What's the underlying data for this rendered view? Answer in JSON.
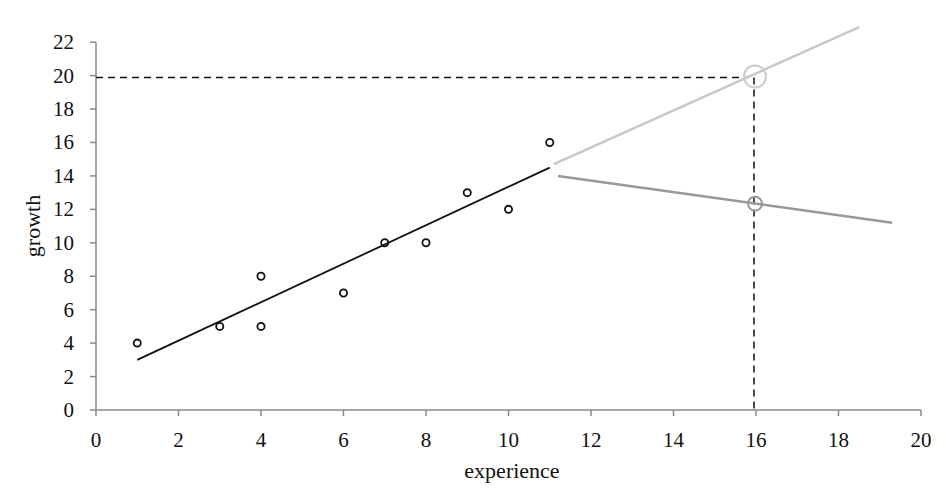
{
  "chart_data": {
    "type": "scatter",
    "title": "",
    "xlabel": "experience",
    "ylabel": "growth",
    "xlim": [
      0,
      20
    ],
    "ylim": [
      0,
      22
    ],
    "x_ticks": [
      0,
      2,
      4,
      6,
      8,
      10,
      12,
      14,
      16,
      18,
      20
    ],
    "y_ticks": [
      0,
      2,
      4,
      6,
      8,
      10,
      12,
      14,
      16,
      18,
      20,
      22
    ],
    "grid": false,
    "legend": null,
    "points": [
      {
        "x": 1,
        "y": 4
      },
      {
        "x": 3,
        "y": 5
      },
      {
        "x": 4,
        "y": 8
      },
      {
        "x": 4,
        "y": 5
      },
      {
        "x": 6,
        "y": 7
      },
      {
        "x": 7,
        "y": 10
      },
      {
        "x": 8,
        "y": 10
      },
      {
        "x": 9,
        "y": 13
      },
      {
        "x": 10,
        "y": 12
      },
      {
        "x": 11,
        "y": 16
      }
    ],
    "lines": [
      {
        "name": "fit",
        "color": "#111111",
        "x": [
          1,
          11
        ],
        "y": [
          3,
          14.5
        ]
      },
      {
        "name": "extrapolation-up",
        "color": "#c8c8c8",
        "x": [
          11.1,
          18.5
        ],
        "y": [
          14.7,
          22.9
        ]
      },
      {
        "name": "extrapolation-down",
        "color": "#999999",
        "x": [
          11.2,
          19.3
        ],
        "y": [
          14.0,
          11.2
        ]
      }
    ],
    "reference_lines": [
      {
        "type": "dashed-horizontal",
        "y": 20,
        "x_from": 0,
        "x_to": 16
      },
      {
        "type": "dashed-vertical",
        "x": 16,
        "y_from": 0,
        "y_to": 20
      }
    ],
    "highlight_markers": [
      {
        "x": 16,
        "y": 20,
        "color": "#cccccc"
      },
      {
        "x": 16,
        "y": 12.4,
        "color": "#999999"
      }
    ]
  }
}
